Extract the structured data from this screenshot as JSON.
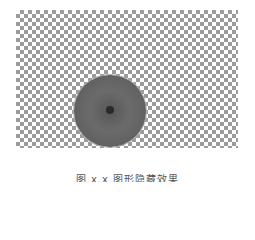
{
  "figure": {
    "background": "checkerboard-transparency",
    "checker_colors": [
      "#8a8a8a",
      "#ffffff"
    ],
    "object": "orange-slice"
  },
  "caption": {
    "text": "图 x.x  图形隐藏效果"
  }
}
